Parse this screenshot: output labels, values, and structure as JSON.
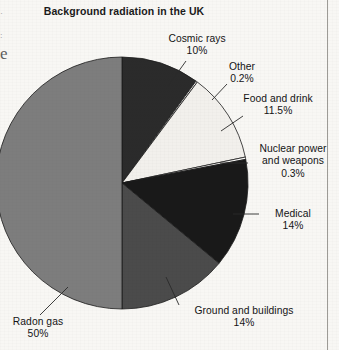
{
  "page": {
    "background_color": "#f8f7f4",
    "rule_color": "#9d9b96"
  },
  "edge_artifacts": {
    "fragment_1": "·",
    "fragment_2": ":",
    "fragment_3": "e"
  },
  "chart_data": {
    "type": "pie",
    "title": "Background radiation in the UK",
    "subtitle": "",
    "xlabel": "",
    "ylabel": "",
    "units": "%",
    "total": 100,
    "start_angle_deg": 0,
    "direction": "clockwise",
    "legend_position": "callout-labels",
    "grid": false,
    "categories": [
      "Cosmic rays",
      "Other",
      "Food and drink",
      "Nuclear power and weapons",
      "Medical",
      "Ground and buildings",
      "Radon gas"
    ],
    "values": [
      10,
      0.2,
      11.5,
      0.3,
      14,
      14,
      50
    ],
    "colors": [
      "#2b2b2b",
      "#fbfaf8",
      "#f2f0ec",
      "#fbfaf8",
      "#191919",
      "#4b4b4b",
      "#7d7d7d"
    ],
    "slices": [
      {
        "name": "Cosmic rays",
        "label": "Cosmic rays",
        "value": 10,
        "value_label": "10%",
        "color": "#2b2b2b",
        "stroke": "#1a1a1a"
      },
      {
        "name": "Other",
        "label": "Other",
        "value": 0.2,
        "value_label": "0.2%",
        "color": "#fbfaf8",
        "stroke": "#1a1a1a"
      },
      {
        "name": "Food and drink",
        "label": "Food and drink",
        "value": 11.5,
        "value_label": "11.5%",
        "color": "#f2f0ec",
        "stroke": "#1a1a1a"
      },
      {
        "name": "Nuclear power and weapons",
        "label": "Nuclear power\nand weapons",
        "value": 0.3,
        "value_label": "0.3%",
        "color": "#fbfaf8",
        "stroke": "#1a1a1a"
      },
      {
        "name": "Medical",
        "label": "Medical",
        "value": 14,
        "value_label": "14%",
        "color": "#191919",
        "stroke": "#1a1a1a"
      },
      {
        "name": "Ground and buildings",
        "label": "Ground and buildings",
        "value": 14,
        "value_label": "14%",
        "color": "#4b4b4b",
        "stroke": "#1a1a1a"
      },
      {
        "name": "Radon gas",
        "label": "Radon gas",
        "value": 50,
        "value_label": "50%",
        "color": "#7d7d7d",
        "stroke": "#1a1a1a"
      }
    ],
    "callout_labels": [
      {
        "text": "Cosmic rays\n10%"
      },
      {
        "text": "Other\n0.2%"
      },
      {
        "text": "Food and drink\n11.5%"
      },
      {
        "text": "Nuclear power\nand weapons\n0.3%"
      },
      {
        "text": "Medical\n14%"
      },
      {
        "text": "Ground and buildings\n14%"
      },
      {
        "text": "Radon gas\n50%"
      }
    ]
  }
}
